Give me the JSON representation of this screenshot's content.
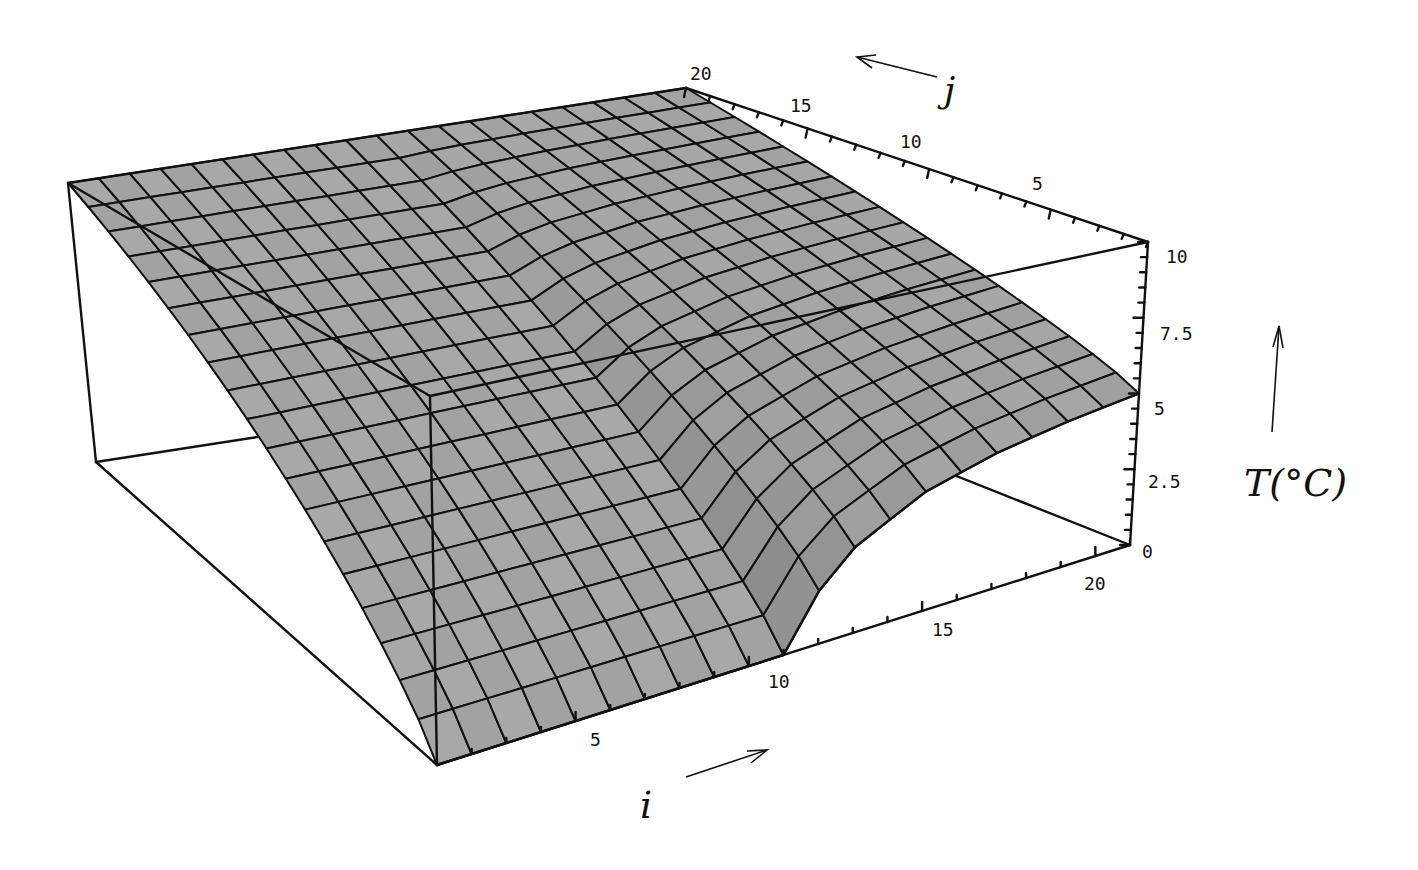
{
  "chart_data": {
    "type": "surface3d",
    "title": "",
    "xlabel": "i",
    "ylabel": "j",
    "zlabel": "T(°C)",
    "x_ticks": [
      5,
      10,
      15,
      20
    ],
    "y_ticks": [
      5,
      10,
      15,
      20
    ],
    "z_ticks": [
      "0",
      "2.5",
      "5",
      "7.5",
      "10"
    ],
    "xlim": [
      1,
      21
    ],
    "ylim": [
      1,
      20
    ],
    "zlim": [
      0,
      10
    ],
    "grid_size": {
      "i": 21,
      "j": 20
    },
    "edges": {
      "j20": {
        "T": 10
      },
      "j1_profile": {
        "i": [
          1,
          3,
          5,
          7,
          9,
          10,
          11,
          12,
          13,
          15,
          17,
          19,
          21
        ],
        "T": [
          0,
          0,
          0,
          0,
          0,
          0,
          0,
          1.6,
          2.6,
          3.7,
          4.3,
          4.7,
          5.0
        ]
      },
      "i1_profile": {
        "j": [
          1,
          5,
          10,
          15,
          20
        ],
        "T": [
          0,
          2.1,
          4.7,
          7.4,
          10
        ]
      }
    },
    "colors": {
      "surface": "#9a9a9a",
      "mesh": "#111111",
      "box": "#111111",
      "background": "#ffffff"
    }
  },
  "axes": {
    "i_label": "i",
    "j_label": "j",
    "t_label": "T(°C)",
    "i_tick_labels": [
      "5",
      "10",
      "15",
      "20"
    ],
    "j_tick_labels": [
      "5",
      "10",
      "15",
      "20"
    ],
    "t_tick_labels": [
      "0",
      "2.5",
      "5",
      "7.5",
      "10"
    ]
  }
}
